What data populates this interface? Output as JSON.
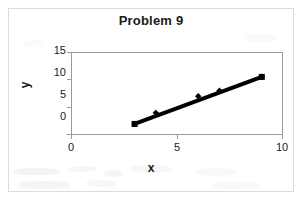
{
  "chart_data": {
    "type": "scatter",
    "title": "Problem 9",
    "xlabel": "x",
    "ylabel": "y",
    "xlim": [
      0,
      10
    ],
    "ylim": [
      0,
      15
    ],
    "xticks": [
      "0",
      "5",
      "10"
    ],
    "yticks": [
      "15",
      "10",
      "5",
      "0"
    ],
    "grid": false,
    "legend": false,
    "series": [
      {
        "name": "data",
        "marker": "diamond",
        "color": "#000000",
        "x": [
          3,
          4,
          6,
          7,
          9
        ],
        "y": [
          2,
          4,
          7,
          8,
          10.5
        ]
      },
      {
        "name": "trendline",
        "type": "line",
        "color": "#000000",
        "x": [
          3,
          9
        ],
        "y": [
          2,
          10.5
        ]
      }
    ],
    "endpoint_markers": [
      {
        "x": 3,
        "y": 2,
        "shape": "square"
      },
      {
        "x": 9,
        "y": 10.5,
        "shape": "square"
      }
    ]
  },
  "chart": {
    "title": "Problem 9",
    "axis_x_title": "x",
    "axis_y_title": "y",
    "x_tick_0": "0",
    "x_tick_5": "5",
    "x_tick_10": "10",
    "y_tick_0": "0",
    "y_tick_5": "5",
    "y_tick_10": "10",
    "y_tick_15": "15",
    "colors": {
      "series": "#000000",
      "axis": "#9a9a9a",
      "frame": "#dcdcdc",
      "text": "#1a1a1a",
      "background": "#ffffff"
    }
  }
}
